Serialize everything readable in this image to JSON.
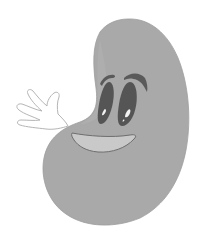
{
  "image": {
    "subject": "cartoon kidney bean character waving",
    "width": 208,
    "height": 238
  },
  "colors": {
    "background": "#ffffff",
    "bean_fill": "#a9a9a9",
    "bean_edge": "#9a9a9a",
    "eye_fill": "#555555",
    "brow_fill": "#5a5a5a",
    "eye_highlight": "#f2f2f2",
    "mouth_fill": "#c9c9c9",
    "mouth_stroke": "#6e6e6e",
    "hand_fill": "#ffffff",
    "hand_stroke": "#b5b5b5"
  }
}
